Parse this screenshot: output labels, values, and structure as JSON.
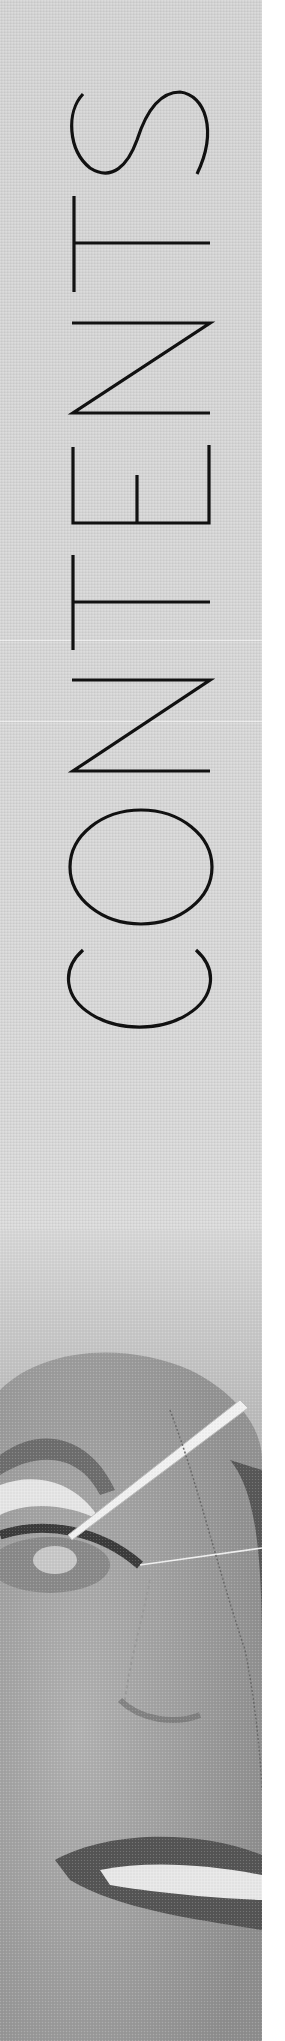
{
  "page": {
    "title": "CONTENTS",
    "letters": [
      "C",
      "O",
      "N",
      "T",
      "E",
      "N",
      "T",
      "S"
    ],
    "orientation": "vertical, reading bottom-to-top"
  },
  "colors": {
    "panel": "#d6d6d6",
    "ink": "#111111",
    "background": "#ffffff"
  },
  "photo": {
    "description": "Grayscale close-up of a fabric doll face with a needle and thread near the eye"
  }
}
